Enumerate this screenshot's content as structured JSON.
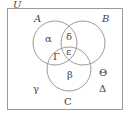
{
  "diagram": {
    "type": "venn",
    "universe_label": "U",
    "sets": [
      {
        "name": "A",
        "label": "A"
      },
      {
        "name": "B",
        "label": "B"
      },
      {
        "name": "C",
        "label": "C"
      }
    ],
    "regions": {
      "A_only": "α",
      "A_and_B_only": "δ",
      "A_B_C": "ε",
      "A_and_C_only": "Γ",
      "C_only": "β",
      "B_only_lower": "Θ",
      "outside_left": "γ",
      "outside_right": "Δ"
    },
    "colors": {
      "stroke": "#9a9a9a",
      "text": "#444444"
    }
  }
}
